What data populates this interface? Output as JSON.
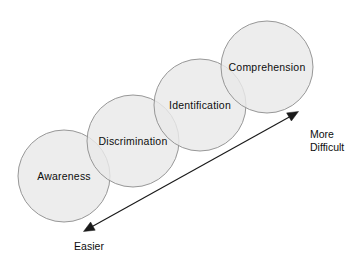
{
  "diagram": {
    "type": "overlapping-circles-progression",
    "background_color": "#ffffff",
    "circle_fill_color": "#e9e9e9",
    "circle_stroke_color": "#8c8c8c",
    "arrow_color": "#1a1a1a",
    "stages": [
      {
        "label": "Awareness",
        "order": 1,
        "cx": 64,
        "cy": 176,
        "r": 46,
        "label_x": 64,
        "label_y": 176
      },
      {
        "label": "Discrimination",
        "order": 2,
        "cx": 133,
        "cy": 141,
        "r": 46,
        "label_x": 133,
        "label_y": 141
      },
      {
        "label": "Identification",
        "order": 3,
        "cx": 200,
        "cy": 105,
        "r": 46,
        "label_x": 200,
        "label_y": 105
      },
      {
        "label": "Comprehension",
        "order": 4,
        "cx": 267,
        "cy": 67,
        "r": 46,
        "label_x": 267,
        "label_y": 67
      }
    ],
    "axis": {
      "start_x": 84,
      "start_y": 231,
      "end_x": 298,
      "end_y": 112,
      "double_headed": true,
      "easier_label": "Easier",
      "difficult_label_line1": "More",
      "difficult_label_line2": "Difficult"
    }
  }
}
